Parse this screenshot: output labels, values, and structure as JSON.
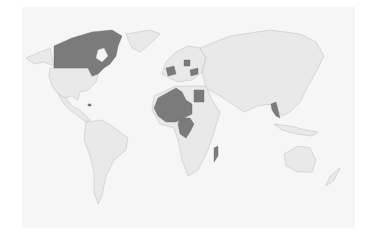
{
  "map": {
    "type": "choropleth-world",
    "projection": "robinson-like",
    "colors": {
      "background": "#ffffff",
      "panel": "#f6f6f6",
      "land": "#e9e9e9",
      "border": "#bdbdbd",
      "highlight": "#7b7b7b"
    },
    "highlighted_countries": [
      "Canada",
      "France",
      "Poland",
      "Ukraine",
      "Algeria",
      "Mali",
      "Niger",
      "Chad",
      "Egypt",
      "Central African Republic",
      "Democratic Republic of the Congo",
      "Madagascar",
      "Laos",
      "Haiti"
    ]
  }
}
